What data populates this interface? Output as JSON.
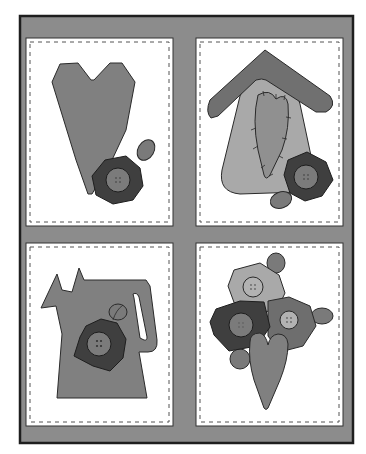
{
  "illustration": {
    "title": "",
    "panels": [
      {
        "id": "heart-panel",
        "subject": "tall heart with flower button and leaf"
      },
      {
        "id": "birdhouse-panel",
        "subject": "birdhouse with stitched heart, flower button and leaf"
      },
      {
        "id": "watering-can-panel",
        "subject": "watering can with flower button and leaf"
      },
      {
        "id": "bouquet-panel",
        "subject": "three flower buttons with leaves and heart"
      }
    ]
  },
  "colors": {
    "page": "#ffffff",
    "frame": "#8c8c8c",
    "frame_border": "#1e1e1e",
    "panel": "#ffffff",
    "stitch": "#555555",
    "heart": "#808080",
    "flower_dark": "#3f3f3f",
    "flower_mid": "#6e6e6e",
    "flower_light": "#a9a9a9",
    "button": "#7b7b7b",
    "button_light": "#b2b2b2",
    "leaf": "#7a7a7a",
    "birdhouse": "#a9a9a9",
    "roof": "#707070",
    "outline": "#2a2a2a"
  }
}
